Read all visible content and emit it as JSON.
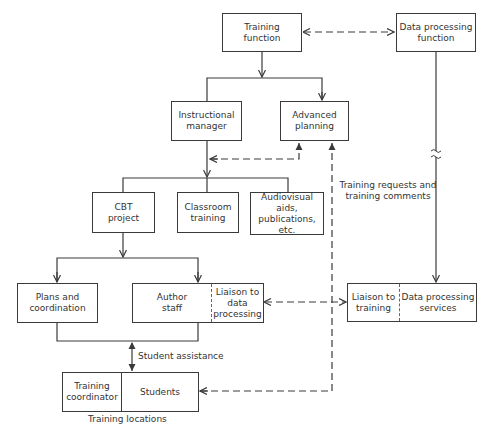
{
  "diagram": {
    "nodes": {
      "training_function": "Training\nfunction",
      "data_processing_function": "Data processing\nfunction",
      "instructional_manager": "Instructional\nmanager",
      "advanced_planning": "Advanced\nplanning",
      "cbt_project": "CBT\nproject",
      "classroom_training": "Classroom\ntraining",
      "audiovisual": "Audiovisual aids,\npublications,\netc.",
      "plans_coordination": "Plans and\ncoordination",
      "author_staff": "Author\nstaff",
      "liaison_to_data_processing": "Liaison to\ndata\nprocessing",
      "liaison_to_training": "Liaison to\ntraining",
      "data_processing_services": "Data processing\nservices",
      "training_coordinator": "Training\ncoordinator",
      "students": "Students"
    },
    "labels": {
      "training_requests": "Training requests and\ntraining comments",
      "student_assistance": "Student assistance",
      "training_locations": "Training locations"
    },
    "edges": [
      {
        "from": "training_function",
        "to": "data_processing_function",
        "style": "dashed",
        "direction": "both"
      },
      {
        "from": "training_function",
        "to": "instructional_manager",
        "style": "solid",
        "direction": "forward"
      },
      {
        "from": "training_function",
        "to": "advanced_planning",
        "style": "solid",
        "direction": "forward"
      },
      {
        "from": "instructional_manager",
        "to": "advanced_planning",
        "style": "dashed",
        "direction": "both"
      },
      {
        "from": "instructional_manager",
        "to": "cbt_project",
        "style": "solid",
        "direction": "forward"
      },
      {
        "from": "instructional_manager",
        "to": "classroom_training",
        "style": "solid",
        "direction": "forward"
      },
      {
        "from": "instructional_manager",
        "to": "audiovisual",
        "style": "solid",
        "direction": "forward"
      },
      {
        "from": "cbt_project",
        "to": "plans_coordination",
        "style": "solid",
        "direction": "forward"
      },
      {
        "from": "cbt_project",
        "to": "author_staff",
        "style": "solid",
        "direction": "forward"
      },
      {
        "from": "liaison_to_data_processing",
        "to": "liaison_to_training",
        "style": "dashed",
        "direction": "both"
      },
      {
        "from": "data_processing_function",
        "to": "data_processing_services",
        "style": "solid",
        "direction": "forward",
        "note": "broken line"
      },
      {
        "from": "students",
        "to": "advanced_planning",
        "style": "dashed",
        "direction": "both",
        "label": "training_requests"
      },
      {
        "from": "plans_coordination",
        "to": "students",
        "style": "solid",
        "direction": "both",
        "label": "student_assistance"
      }
    ]
  },
  "colors": {
    "line": "#3a3a3a",
    "text": "#333333",
    "background": "#ffffff"
  }
}
